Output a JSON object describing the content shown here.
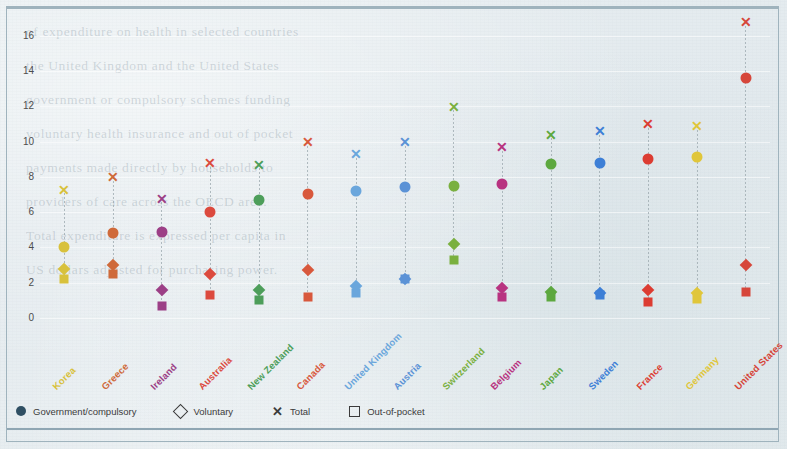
{
  "ghost_lines": [
    "of expenditure on  health   in  selected  countries",
    "the  United  Kingdom  and  the  United  States",
    "government  or  compulsory  schemes  funding",
    "voluntary health insurance and out of pocket",
    "payments made directly by households to",
    "providers of care across the OECD area.",
    "Total expenditure is expressed per capita in",
    "US dollars adjusted for purchasing power."
  ],
  "chart": {
    "type": "scatter",
    "ylabel": "",
    "xlabel": "",
    "ylim": [
      0,
      17
    ],
    "yticks": [
      0,
      2,
      4,
      6,
      8,
      10,
      12,
      14,
      16
    ],
    "ytick_labels": [
      "0",
      "2",
      "4",
      "6",
      "8",
      "10",
      "12",
      "14",
      "16"
    ],
    "grid": true,
    "series_names": [
      "Government/compulsory",
      "Voluntary",
      "Total",
      "Out-of-pocket"
    ],
    "categories": [
      "Korea",
      "Greece",
      "Ireland",
      "Australia",
      "New Zealand",
      "Canada",
      "United Kingdom",
      "Austria",
      "Switzerland",
      "Belgium",
      "Japan",
      "Sweden",
      "France",
      "Germany",
      "United States"
    ],
    "category_colors": [
      "#d8c13c",
      "#cf6a3a",
      "#9c3f86",
      "#dc4a3e",
      "#4d9e5a",
      "#d8583c",
      "#6aa6dc",
      "#5b92d6",
      "#7ab03f",
      "#b83380",
      "#5da83f",
      "#3d7fd6",
      "#dc3c32",
      "#e0c63a",
      "#d6463a"
    ],
    "series": [
      {
        "name": "Total",
        "marker": "cross",
        "values": [
          7.3,
          8.0,
          6.8,
          8.8,
          8.7,
          10.0,
          9.3,
          10.0,
          12.0,
          9.7,
          10.4,
          10.6,
          11.0,
          10.9,
          16.8
        ]
      },
      {
        "name": "Government/compulsory",
        "marker": "circle",
        "values": [
          4.0,
          4.8,
          4.9,
          6.0,
          6.7,
          7.0,
          7.2,
          7.4,
          7.5,
          7.6,
          8.7,
          8.8,
          9.0,
          9.1,
          13.6
        ]
      },
      {
        "name": "Voluntary",
        "marker": "diamond",
        "values": [
          2.8,
          3.0,
          1.6,
          2.5,
          1.6,
          2.7,
          1.8,
          2.2,
          4.2,
          1.7,
          1.5,
          1.4,
          1.6,
          1.4,
          3.0
        ]
      },
      {
        "name": "Out-of-pocket",
        "marker": "square",
        "values": [
          2.2,
          2.5,
          0.7,
          1.3,
          1.0,
          1.2,
          1.4,
          2.2,
          3.3,
          1.2,
          1.2,
          1.3,
          0.9,
          1.1,
          1.5
        ]
      }
    ]
  },
  "legend": {
    "position": "bottom-left",
    "items": [
      {
        "label": "Government/compulsory",
        "icon": "filled-circle-icon"
      },
      {
        "label": "Voluntary",
        "icon": "open-diamond-icon"
      },
      {
        "label": "Total",
        "icon": "cross-icon"
      },
      {
        "label": "Out-of-pocket",
        "icon": "open-square-icon"
      }
    ]
  }
}
